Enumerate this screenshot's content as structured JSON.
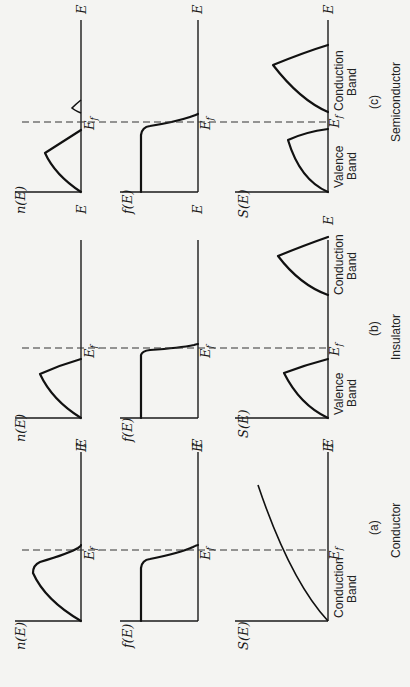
{
  "figure": {
    "orientation": "rotated 90deg counterclockwise",
    "axis_labels": {
      "energy": "E",
      "fermi": "E",
      "fermi_sub": "f",
      "density": "n(E)",
      "distribution": "f(E)",
      "states": "S(E)"
    },
    "panels": [
      {
        "id": "c",
        "tag": "(c)",
        "title": "Semiconductor",
        "band_labels": [
          {
            "line1": "Valence",
            "line2": "Band"
          },
          {
            "line1": "Conduction",
            "line2": "Band"
          }
        ]
      },
      {
        "id": "b",
        "tag": "(b)",
        "title": "Insulator",
        "band_labels": [
          {
            "line1": "Valence",
            "line2": "Band"
          },
          {
            "line1": "Conduction",
            "line2": "Band"
          }
        ]
      },
      {
        "id": "a",
        "tag": "(a)",
        "title": "Conductor",
        "band_labels": [
          {
            "line1": "Conduction",
            "line2": "Band"
          }
        ]
      }
    ],
    "colors": {
      "background": "#f4f4f2",
      "ink": "#111111"
    }
  }
}
